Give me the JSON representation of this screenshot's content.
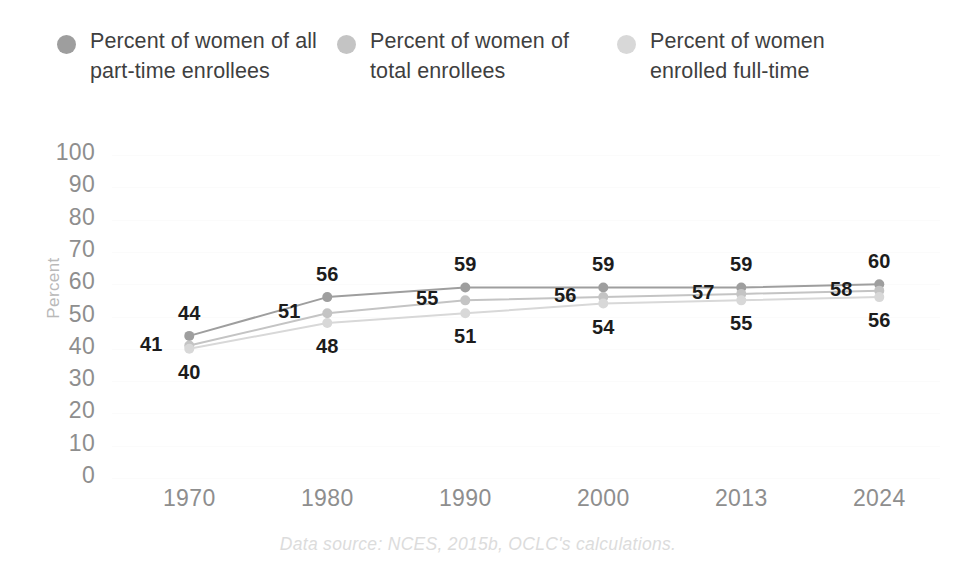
{
  "legend": {
    "items": [
      {
        "label": "Percent of women of all part-time enrollees",
        "color": "#9e9e9e",
        "icon": "legend-dot-icon"
      },
      {
        "label": "Percent of women of total enrollees",
        "color": "#c4c4c4",
        "icon": "legend-dot-icon"
      },
      {
        "label": "Percent of women enrolled full-time",
        "color": "#d8d8d8",
        "icon": "legend-dot-icon"
      }
    ]
  },
  "caption": "Data source: NCES, 2015b, OCLC's calculations.",
  "chart_data": {
    "type": "line",
    "title": "",
    "xlabel": "",
    "ylabel": "Percent",
    "categories": [
      "1970",
      "1980",
      "1990",
      "2000",
      "2013",
      "2024"
    ],
    "ylim": [
      0,
      100
    ],
    "yticks": [
      100,
      90,
      80,
      70,
      60,
      50,
      40,
      30,
      20,
      10,
      0
    ],
    "grid": true,
    "legend_position": "top",
    "series": [
      {
        "name": "Percent of women of all part-time enrollees",
        "color": "#9e9e9e",
        "values": [
          44,
          56,
          59,
          59,
          59,
          60
        ],
        "label_side": "above"
      },
      {
        "name": "Percent of women of total enrollees",
        "color": "#c4c4c4",
        "values": [
          41,
          51,
          55,
          56,
          57,
          58
        ],
        "label_side": "left"
      },
      {
        "name": "Percent of women enrolled full-time",
        "color": "#d8d8d8",
        "values": [
          40,
          48,
          51,
          54,
          55,
          56
        ],
        "label_side": "below"
      }
    ]
  }
}
